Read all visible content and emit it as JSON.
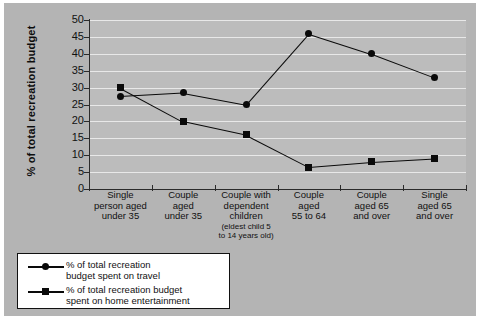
{
  "chart_data": {
    "type": "line",
    "title": "",
    "subtitle": "",
    "xlabel": "",
    "ylabel": "% of total recreation budget",
    "ylim": [
      0,
      50
    ],
    "ytick_step": 5,
    "yticks": [
      50,
      45,
      40,
      35,
      30,
      25,
      20,
      15,
      10,
      5,
      0
    ],
    "grid": true,
    "legend_position": "bottom-left",
    "categories": [
      "Single person aged under 35",
      "Couple aged under 35",
      "Couple with dependent children (eldest child 5 to 14 years old)",
      "Couple aged 55 to 64",
      "Couple aged 65 and over",
      "Single aged 65 and over"
    ],
    "category_lines": [
      [
        "Single",
        "person aged",
        "under 35"
      ],
      [
        "Couple",
        "aged",
        "under 35"
      ],
      [
        "Couple with",
        "dependent",
        "children"
      ],
      [
        "Couple",
        "aged",
        "55 to 64"
      ],
      [
        "Couple",
        "aged 65",
        "and over"
      ],
      [
        "Single",
        "aged 65",
        "and over"
      ]
    ],
    "category_small_lines": [
      [],
      [],
      [
        "(eldest child 5",
        "to 14 years old)"
      ],
      [],
      [],
      []
    ],
    "series": [
      {
        "name": "% of total recreation budget spent on travel",
        "marker": "circle",
        "values": [
          27.5,
          28.5,
          25.0,
          46.0,
          40.0,
          33.0
        ]
      },
      {
        "name": "% of total recreation budget spent on home entertainment",
        "marker": "square",
        "values": [
          30.0,
          20.0,
          16.0,
          6.5,
          8.0,
          9.0
        ]
      }
    ]
  },
  "legend": {
    "entries": [
      {
        "marker": "circle",
        "lines": [
          "% of total recreation",
          "budget spent on travel"
        ]
      },
      {
        "marker": "square",
        "lines": [
          "% of total recreation budget",
          "spent on home entertainment"
        ]
      }
    ]
  },
  "colors": {
    "page_background": "#ffffff",
    "panel_background": "#b4b4b4",
    "plot_background": "#bcbcbc",
    "gridline": "#e8e8e8",
    "axis": "#2b2b2b",
    "series_marker": "#0a0a0a",
    "legend_background": "#ffffff",
    "legend_border": "#111111"
  }
}
